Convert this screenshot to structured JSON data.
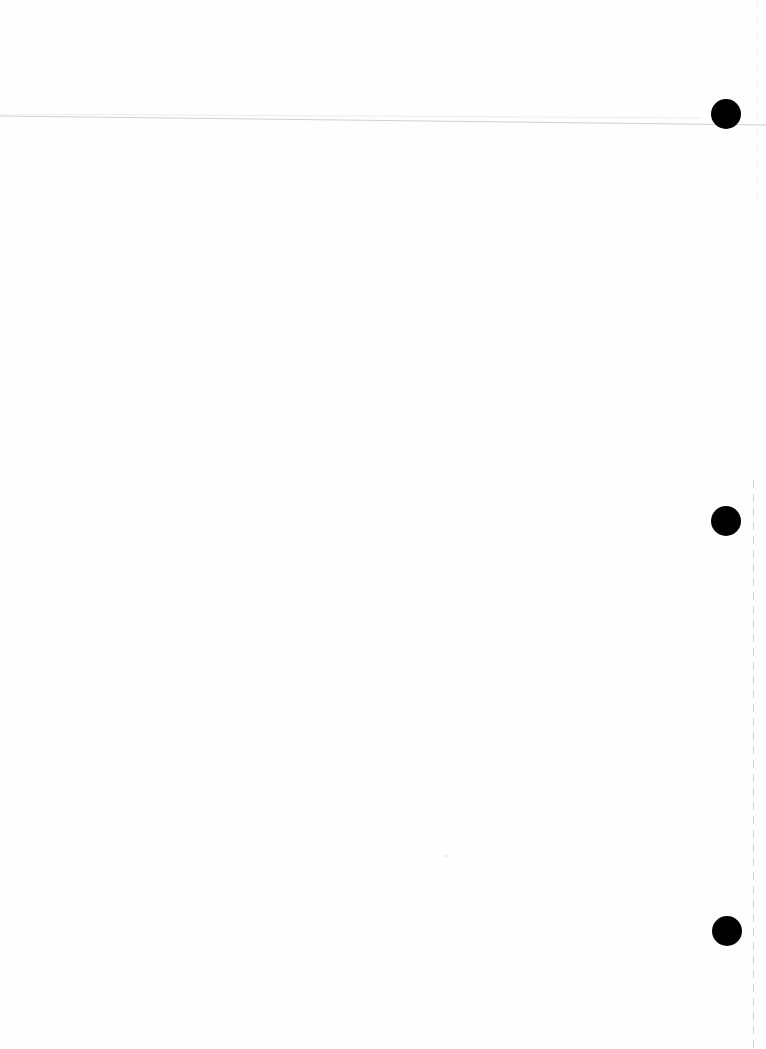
{
  "document": {
    "type": "blank scanned page",
    "background_color": "#fefefe",
    "punch_holes": [
      {
        "label": "punch-hole-top",
        "cx": 726,
        "cy": 114
      },
      {
        "label": "punch-hole-middle",
        "cx": 726,
        "cy": 521
      },
      {
        "label": "punch-hole-bottom",
        "cx": 727,
        "cy": 931
      }
    ],
    "hole_color": "#000000",
    "rule_color": "#d0d0d0",
    "edge_dash_color": "#c8c8c8"
  }
}
